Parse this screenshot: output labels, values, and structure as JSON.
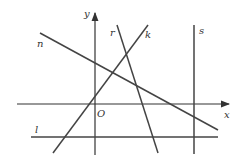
{
  "diagram": {
    "type": "coordinate-plane-lines",
    "axes": {
      "x_label": "x",
      "y_label": "y",
      "origin_label": "O"
    },
    "lines": [
      {
        "name": "n",
        "label": "n",
        "x1": 40,
        "y1": 33,
        "x2": 218,
        "y2": 130
      },
      {
        "name": "r",
        "label": "r",
        "x1": 117,
        "y1": 25,
        "x2": 158,
        "y2": 153
      },
      {
        "name": "k",
        "label": "k",
        "x1": 148,
        "y1": 25,
        "x2": 53,
        "y2": 153
      },
      {
        "name": "s",
        "label": "s",
        "x1": 194,
        "y1": 25,
        "x2": 194,
        "y2": 154
      },
      {
        "name": "l",
        "label": "l",
        "x1": 31,
        "y1": 137,
        "x2": 218,
        "y2": 137
      }
    ],
    "colors": {
      "line": "#444444",
      "axis": "#333333"
    }
  }
}
